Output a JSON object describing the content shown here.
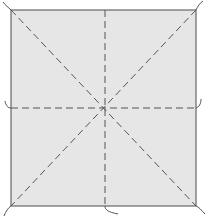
{
  "diagram": {
    "type": "origami-crease-pattern",
    "shape": "square",
    "canvas": {
      "width": 208,
      "height": 219
    },
    "square": {
      "x": 11,
      "y": 10,
      "width": 185,
      "height": 196
    },
    "center": {
      "x": 105,
      "y": 108
    },
    "colors": {
      "paper_fill": "#e6e6e6",
      "border": "#4a4a4a",
      "crease": "#555555",
      "tail": "#555555",
      "background": "#ffffff"
    },
    "creases": [
      {
        "name": "diagonal-tl-br",
        "style": "dashed",
        "from": [
          11,
          10
        ],
        "to": [
          196,
          206
        ]
      },
      {
        "name": "diagonal-tr-bl",
        "style": "dashed",
        "from": [
          196,
          10
        ],
        "to": [
          11,
          206
        ]
      },
      {
        "name": "vertical-center",
        "style": "dashed",
        "from": [
          105,
          10
        ],
        "to": [
          105,
          206
        ]
      },
      {
        "name": "horizontal-center",
        "style": "dashed",
        "from": [
          11,
          108
        ],
        "to": [
          196,
          108
        ]
      }
    ],
    "tails": [
      {
        "name": "tail-top-left",
        "path": "M11 10 C 8 7, 6 6, 3 2"
      },
      {
        "name": "tail-top-right",
        "path": "M196 10 C 198 6, 199 4, 203 1"
      },
      {
        "name": "tail-bottom-left",
        "path": "M11 206 C 8 208, 6 211, 4 216"
      },
      {
        "name": "tail-bottom-right",
        "path": "M196 206 C 199 207, 201 210, 205 214"
      },
      {
        "name": "tail-left-mid",
        "path": "M11 108 C 8 108, 6 106, 5 101"
      },
      {
        "name": "tail-right-mid",
        "path": "M196 108 C 199 107, 201 104, 201 99"
      },
      {
        "name": "tail-bottom-mid",
        "path": "M105 206 C 105 210, 108 212, 118 214"
      }
    ]
  }
}
